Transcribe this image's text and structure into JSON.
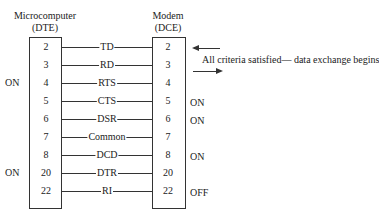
{
  "dte": {
    "title": "Microcomputer",
    "subtitle": "(DTE)"
  },
  "dce": {
    "title": "Modem",
    "subtitle": "(DCE)"
  },
  "note": "All criteria satisfied— data exchange begins",
  "arrows": [
    {
      "name": "arrow-left",
      "direction": "left"
    },
    {
      "name": "arrow-right",
      "direction": "right"
    }
  ],
  "rows": [
    {
      "dte_pin": "2",
      "signal": "TD",
      "dce_pin": "2",
      "dte_state": "",
      "dce_state": ""
    },
    {
      "dte_pin": "3",
      "signal": "RD",
      "dce_pin": "3",
      "dte_state": "",
      "dce_state": ""
    },
    {
      "dte_pin": "4",
      "signal": "RTS",
      "dce_pin": "4",
      "dte_state": "ON",
      "dce_state": ""
    },
    {
      "dte_pin": "5",
      "signal": "CTS",
      "dce_pin": "5",
      "dte_state": "",
      "dce_state": "ON"
    },
    {
      "dte_pin": "6",
      "signal": "DSR",
      "dce_pin": "6",
      "dte_state": "",
      "dce_state": "ON"
    },
    {
      "dte_pin": "7",
      "signal": "Common",
      "dce_pin": "7",
      "dte_state": "",
      "dce_state": ""
    },
    {
      "dte_pin": "8",
      "signal": "DCD",
      "dce_pin": "8",
      "dte_state": "",
      "dce_state": "ON"
    },
    {
      "dte_pin": "20",
      "signal": "DTR",
      "dce_pin": "20",
      "dte_state": "ON",
      "dce_state": ""
    },
    {
      "dte_pin": "22",
      "signal": "RI",
      "dce_pin": "22",
      "dte_state": "",
      "dce_state": "OFF"
    }
  ]
}
